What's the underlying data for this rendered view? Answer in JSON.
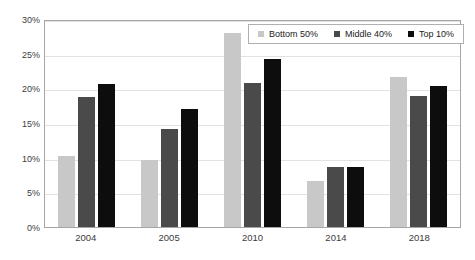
{
  "chart_data": {
    "type": "bar",
    "title": "",
    "subtitle": "",
    "xlabel": "",
    "ylabel": "",
    "categories": [
      "2004",
      "2005",
      "2010",
      "2014",
      "2018"
    ],
    "series": [
      {
        "name": "Bottom 50%",
        "color": "#c8c8c8",
        "values": [
          10.2,
          9.6,
          28.0,
          6.6,
          21.6
        ]
      },
      {
        "name": "Middle 40%",
        "color": "#4a4a4a",
        "values": [
          18.8,
          14.1,
          20.7,
          8.7,
          18.9
        ]
      },
      {
        "name": "Top 10%",
        "color": "#0d0d0d",
        "values": [
          20.6,
          17.0,
          24.3,
          8.7,
          20.3
        ]
      }
    ],
    "ylim": [
      0,
      30
    ],
    "ytick_values": [
      0,
      5,
      10,
      15,
      20,
      25,
      30
    ],
    "ytick_labels": [
      "0%",
      "5%",
      "10%",
      "15%",
      "20%",
      "25%",
      "30%"
    ],
    "grid": true,
    "grid_axis": "y",
    "legend_position": "top-right",
    "plot_border_color": "#a6a6a6",
    "gridline_color": "#e2e2e2",
    "background_color": "#ffffff"
  }
}
